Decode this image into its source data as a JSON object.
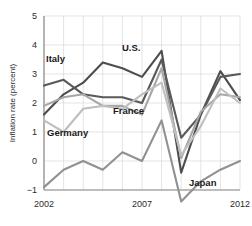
{
  "chart_data": {
    "type": "line",
    "title": "",
    "xlabel": "",
    "ylabel": "Inflation rate (percent)",
    "xlim": [
      2002,
      2012
    ],
    "ylim": [
      -1,
      5
    ],
    "grid": true,
    "legend": "inline-annotations",
    "x": [
      2002,
      2003,
      2004,
      2005,
      2006,
      2007,
      2008,
      2009,
      2010,
      2011,
      2012
    ],
    "xticks": [
      2002,
      2007,
      2012
    ],
    "xticklabels": [
      "2002",
      "2007",
      "2012"
    ],
    "yticks": [
      -1,
      0,
      1,
      2,
      3,
      4,
      5
    ],
    "yticklabels": [
      "−1",
      "0",
      "1",
      "2",
      "3",
      "4",
      "5"
    ],
    "series": [
      {
        "name": "U.S.",
        "color": "#4d4d4d",
        "values": [
          1.6,
          2.3,
          2.7,
          3.4,
          3.2,
          2.9,
          3.8,
          -0.4,
          1.6,
          3.1,
          2.1
        ]
      },
      {
        "name": "Italy",
        "color": "#595959",
        "values": [
          2.6,
          2.8,
          2.3,
          2.2,
          2.2,
          2.0,
          3.5,
          0.8,
          1.6,
          2.9,
          3.0
        ]
      },
      {
        "name": "France",
        "color": "#a6a6a6",
        "values": [
          1.9,
          2.2,
          2.3,
          1.9,
          1.9,
          1.6,
          3.2,
          0.1,
          1.7,
          2.3,
          2.2
        ]
      },
      {
        "name": "Germany",
        "color": "#bfbfbf",
        "values": [
          1.4,
          1.0,
          1.8,
          1.9,
          1.8,
          2.3,
          2.7,
          0.2,
          1.2,
          2.5,
          2.0
        ]
      },
      {
        "name": "Japan",
        "color": "#919191",
        "values": [
          -0.9,
          -0.3,
          0.0,
          -0.3,
          0.3,
          0.0,
          1.4,
          -1.4,
          -0.7,
          -0.3,
          0.0
        ]
      }
    ],
    "annotations": [
      {
        "text": "Italy",
        "x_px": 46,
        "y_px": 62
      },
      {
        "text": "U.S.",
        "x_px": 122,
        "y_px": 51
      },
      {
        "text": "France",
        "x_px": 113,
        "y_px": 114
      },
      {
        "text": "Germany",
        "x_px": 47,
        "y_px": 136
      },
      {
        "text": "Japan",
        "x_px": 189,
        "y_px": 186
      }
    ]
  }
}
